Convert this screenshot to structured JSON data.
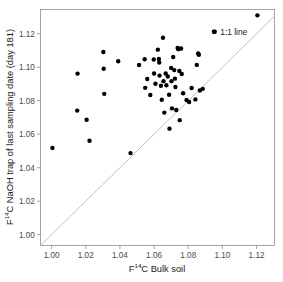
{
  "chart_data": {
    "type": "scatter",
    "title": "",
    "xlabel": "F14C Bulk soil",
    "xlabel_parts": {
      "pre": "F",
      "sup": "14",
      "post": "C Bulk soil"
    },
    "ylabel": "F14C NaOH trap of last sampling date (day 181)",
    "ylabel_parts": {
      "pre": "F",
      "sup": "14",
      "post": "C NaOH trap of last sampling date (day 181)"
    },
    "xlim": [
      0.9935,
      1.1305
    ],
    "ylim": [
      0.9935,
      1.1345
    ],
    "xticks": [
      1.0,
      1.02,
      1.04,
      1.06,
      1.08,
      1.1,
      1.12
    ],
    "xticklabels": [
      "1.00",
      "1.02",
      "1.04",
      "1.06",
      "1.08",
      "1.10",
      "1.12"
    ],
    "yticks": [
      1.0,
      1.02,
      1.04,
      1.06,
      1.08,
      1.1,
      1.12
    ],
    "yticklabels": [
      "1.00",
      "1.02",
      "1.04",
      "1.06",
      "1.08",
      "1.10",
      "1.12"
    ],
    "grid": false,
    "legend": false,
    "marker": "filled-circle",
    "marker_color": "#000000",
    "marker_size_px": 4.4,
    "reference_line": {
      "label": "1:1 line",
      "slope": 1,
      "intercept": 0,
      "color": "#b0b0b0",
      "label_x": 1.0955,
      "label_y": 1.1212
    },
    "series": [
      {
        "name": "NaOH trap vs bulk soil",
        "points": [
          [
            1.0005,
            1.0518
          ],
          [
            1.0152,
            1.0962
          ],
          [
            1.015,
            1.0741
          ],
          [
            1.0205,
            1.0686
          ],
          [
            1.0222,
            1.0561
          ],
          [
            1.0303,
            1.1091
          ],
          [
            1.0305,
            1.0991
          ],
          [
            1.0308,
            1.0841
          ],
          [
            1.039,
            1.1036
          ],
          [
            1.0462,
            1.0487
          ],
          [
            1.0512,
            1.1013
          ],
          [
            1.0545,
            1.1048
          ],
          [
            1.0548,
            1.0877
          ],
          [
            1.056,
            1.093
          ],
          [
            1.0578,
            1.0834
          ],
          [
            1.0598,
            1.1046
          ],
          [
            1.06,
            1.0963
          ],
          [
            1.0608,
            1.0901
          ],
          [
            1.0622,
            1.1105
          ],
          [
            1.0628,
            1.1049
          ],
          [
            1.063,
            1.1028
          ],
          [
            1.0632,
            1.095
          ],
          [
            1.064,
            1.0889
          ],
          [
            1.0645,
            1.0806
          ],
          [
            1.0652,
            1.1176
          ],
          [
            1.0655,
            1.0917
          ],
          [
            1.066,
            1.0729
          ],
          [
            1.0668,
            1.0963
          ],
          [
            1.0672,
            1.0892
          ],
          [
            1.068,
            1.0945
          ],
          [
            1.0688,
            1.0836
          ],
          [
            1.069,
            1.0633
          ],
          [
            1.07,
            1.0996
          ],
          [
            1.0702,
            1.0917
          ],
          [
            1.0705,
            1.0754
          ],
          [
            1.0712,
            1.1061
          ],
          [
            1.0718,
            1.0983
          ],
          [
            1.0722,
            1.0932
          ],
          [
            1.0725,
            1.0882
          ],
          [
            1.073,
            1.0745
          ],
          [
            1.0738,
            1.1115
          ],
          [
            1.0742,
            1.1108
          ],
          [
            1.0748,
            1.0978
          ],
          [
            1.075,
            1.0684
          ],
          [
            1.0758,
            1.1112
          ],
          [
            1.0762,
            1.096
          ],
          [
            1.077,
            1.0845
          ],
          [
            1.079,
            1.0804
          ],
          [
            1.0805,
            1.0792
          ],
          [
            1.082,
            1.0876
          ],
          [
            1.0842,
            1.0808
          ],
          [
            1.085,
            1.1014
          ],
          [
            1.0858,
            1.1082
          ],
          [
            1.0862,
            1.1075
          ],
          [
            1.0868,
            1.0861
          ],
          [
            1.0885,
            1.0871
          ],
          [
            1.095,
            1.1212
          ],
          [
            1.1205,
            1.131
          ]
        ]
      }
    ],
    "n_points": 58
  },
  "annotations": {
    "one_to_one_label": "1:1 line"
  }
}
